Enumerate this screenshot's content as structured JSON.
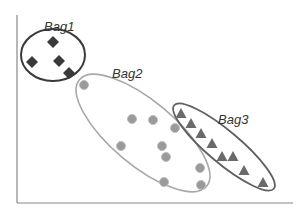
{
  "diagram": {
    "type": "multiple-instance-learning-bags",
    "axes": {
      "color": "#888888",
      "y_axis": {
        "x": 17,
        "y1": 15,
        "y2": 203
      },
      "x_axis": {
        "y": 203,
        "x1": 17,
        "x2": 293
      }
    },
    "bags": [
      {
        "label": "Bag1",
        "label_pos": [
          44,
          31
        ],
        "ellipse": {
          "cx": 53,
          "cy": 55,
          "rx": 32,
          "ry": 26,
          "rotate": 0,
          "stroke": "#3a3a3a",
          "width": 2
        },
        "marker": "diamond",
        "marker_color": "#3a3a3a",
        "points": [
          [
            53,
            42
          ],
          [
            32,
            62
          ],
          [
            59,
            61
          ],
          [
            69,
            73
          ]
        ]
      },
      {
        "label": "Bag2",
        "label_pos": [
          112,
          78
        ],
        "ellipse": {
          "cx": 143,
          "cy": 133,
          "rx": 83,
          "ry": 32,
          "rotate": 40,
          "stroke": "#a8a8a8",
          "width": 1.6
        },
        "marker": "circle",
        "marker_color": "#9a9a9a",
        "points": [
          [
            84,
            85
          ],
          [
            132,
            119
          ],
          [
            153,
            120
          ],
          [
            121,
            146
          ],
          [
            162,
            146
          ],
          [
            166,
            157
          ],
          [
            175,
            128
          ],
          [
            200,
            168
          ],
          [
            201,
            185
          ],
          [
            164,
            182
          ]
        ]
      },
      {
        "label": "Bag3",
        "label_pos": [
          218,
          124
        ],
        "ellipse": {
          "cx": 224,
          "cy": 147,
          "rx": 65,
          "ry": 16,
          "rotate": 40,
          "stroke": "#606060",
          "width": 1.8
        },
        "marker": "triangle",
        "marker_color": "#6a6a6a",
        "points": [
          [
            181,
            114
          ],
          [
            191,
            124
          ],
          [
            201,
            134
          ],
          [
            212,
            144
          ],
          [
            222,
            157
          ],
          [
            233,
            157
          ],
          [
            244,
            171
          ],
          [
            263,
            183
          ]
        ]
      }
    ]
  }
}
